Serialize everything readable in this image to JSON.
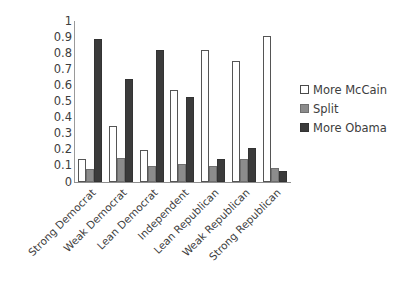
{
  "chart_data": {
    "type": "bar",
    "title": "",
    "subtitle": "",
    "xlabel": "",
    "ylabel": "",
    "ylim": [
      0,
      1
    ],
    "grid": false,
    "legend_position": "right",
    "categories": [
      "Strong Democrat",
      "Weak Democrat",
      "Lean Democrat",
      "Independent",
      "Lean Republican",
      "Weak Republican",
      "Strong Republican"
    ],
    "y_ticks": [
      "0",
      "0.1",
      "0.2",
      "0.3",
      "0.4",
      "0.5",
      "0.6",
      "0.7",
      "0.8",
      "0.9",
      "1"
    ],
    "y_tick_values": [
      0,
      0.1,
      0.2,
      0.3,
      0.4,
      0.5,
      0.6,
      0.7,
      0.8,
      0.9,
      1
    ],
    "series": [
      {
        "name": "More McCain",
        "color": "#ffffff",
        "values": [
          0.14,
          0.35,
          0.2,
          0.57,
          0.82,
          0.75,
          0.91
        ]
      },
      {
        "name": "Split",
        "color": "#8c8c8c",
        "values": [
          0.08,
          0.15,
          0.1,
          0.11,
          0.1,
          0.14,
          0.09
        ]
      },
      {
        "name": "More Obama",
        "color": "#3b3b3b",
        "values": [
          0.89,
          0.64,
          0.82,
          0.53,
          0.14,
          0.21,
          0.07
        ]
      }
    ]
  },
  "legend": {
    "items": [
      {
        "label": "More McCain",
        "key": "more-mccain"
      },
      {
        "label": "Split",
        "key": "split"
      },
      {
        "label": "More Obama",
        "key": "more-obama"
      }
    ]
  }
}
